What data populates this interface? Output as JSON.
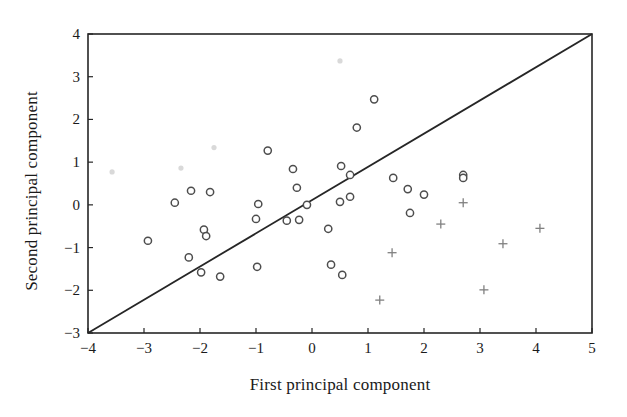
{
  "chart_data": {
    "type": "scatter",
    "title": "",
    "xlabel": "First principal component",
    "ylabel": "Second principal component",
    "xlim": [
      -4,
      5
    ],
    "ylim": [
      -3,
      4
    ],
    "xticks": [
      "−4",
      "−3",
      "−2",
      "−1",
      "0",
      "1",
      "2",
      "3",
      "4",
      "5"
    ],
    "xtick_values": [
      -4,
      -3,
      -2,
      -1,
      0,
      1,
      2,
      3,
      4,
      5
    ],
    "yticks": [
      "−3",
      "−2",
      "−1",
      "0",
      "1",
      "2",
      "3",
      "4"
    ],
    "ytick_values": [
      -3,
      -2,
      -1,
      0,
      1,
      2,
      3,
      4
    ],
    "grid": false,
    "legend": "none",
    "frame": "box",
    "marker_colors": {
      "circle": "#4d4d4d",
      "plus": "#808080",
      "faint": "#d9d9d9",
      "line": "#262626"
    },
    "reference_line": {
      "name": "diagonal-separator",
      "x": [
        -4,
        5
      ],
      "y": [
        -3,
        4
      ],
      "style": "solid",
      "slope": 1,
      "intercept": 1
    },
    "series": [
      {
        "name": "Group A (circles)",
        "marker": "circle",
        "points": [
          [
            -2.93,
            -0.84
          ],
          [
            -2.45,
            0.05
          ],
          [
            -2.16,
            0.33
          ],
          [
            -1.82,
            0.3
          ],
          [
            -2.2,
            -1.23
          ],
          [
            -1.93,
            -0.58
          ],
          [
            -1.89,
            -0.73
          ],
          [
            -1.98,
            -1.58
          ],
          [
            -1.64,
            -1.68
          ],
          [
            -0.79,
            1.27
          ],
          [
            -0.34,
            0.84
          ],
          [
            -0.27,
            0.4
          ],
          [
            -0.96,
            0.02
          ],
          [
            -1.0,
            -0.33
          ],
          [
            -0.09,
            0.0
          ],
          [
            -0.45,
            -0.37
          ],
          [
            -0.23,
            -0.35
          ],
          [
            0.5,
            0.07
          ],
          [
            0.29,
            -0.56
          ],
          [
            -0.98,
            -1.45
          ],
          [
            1.11,
            2.47
          ],
          [
            0.8,
            1.81
          ],
          [
            0.52,
            0.91
          ],
          [
            0.68,
            0.7
          ],
          [
            0.68,
            0.19
          ],
          [
            1.45,
            0.63
          ],
          [
            1.71,
            0.37
          ],
          [
            2.0,
            0.24
          ],
          [
            2.7,
            0.7
          ],
          [
            2.7,
            0.63
          ],
          [
            1.75,
            -0.19
          ],
          [
            0.54,
            -1.64
          ],
          [
            0.34,
            -1.4
          ]
        ]
      },
      {
        "name": "Group B (plus)",
        "marker": "plus",
        "points": [
          [
            2.7,
            0.05
          ],
          [
            2.3,
            -0.45
          ],
          [
            1.43,
            -1.12
          ],
          [
            3.41,
            -0.91
          ],
          [
            4.07,
            -0.55
          ],
          [
            3.07,
            -1.99
          ],
          [
            1.21,
            -2.23
          ]
        ]
      },
      {
        "name": "Faint markers",
        "marker": "faint-dot",
        "points": [
          [
            -3.57,
            0.77
          ],
          [
            -2.34,
            0.86
          ],
          [
            -1.75,
            1.34
          ],
          [
            0.5,
            3.37
          ]
        ]
      }
    ]
  },
  "axes": {
    "x_label": "First principal component",
    "y_label": "Second principal component"
  }
}
